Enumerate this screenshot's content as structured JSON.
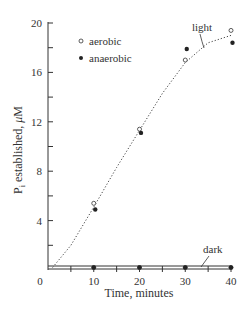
{
  "chart_data": {
    "type": "scatter",
    "title": "",
    "xlabel": "Time, minutes",
    "ylabel": "P_i established, μM",
    "ylabel_parts": {
      "main": "P",
      "sub": "i",
      "rest": " established, ",
      "unit_greek": "μ",
      "unit": "M"
    },
    "xlim": [
      0,
      40
    ],
    "ylim": [
      0,
      20
    ],
    "x_ticks": [
      "0",
      "10",
      "20",
      "30",
      "40"
    ],
    "y_ticks": [
      "4",
      "8",
      "12",
      "16",
      "20"
    ],
    "grid": false,
    "legend_position": "upper left",
    "legend": [
      {
        "label": "aerobic",
        "marker": "open-circle"
      },
      {
        "label": "anaerobic",
        "marker": "filled-circle"
      }
    ],
    "series": [
      {
        "name": "aerobic (light)",
        "marker": "open-circle",
        "x": [
          10,
          20,
          30,
          40
        ],
        "y": [
          5.4,
          11.4,
          17.0,
          19.4
        ]
      },
      {
        "name": "anaerobic (light)",
        "marker": "filled-circle",
        "x": [
          10,
          20,
          30,
          40
        ],
        "y": [
          4.9,
          11.1,
          17.9,
          18.4
        ]
      },
      {
        "name": "aerobic (dark)",
        "marker": "open-circle",
        "x": [
          10,
          20,
          30,
          40
        ],
        "y": [
          0.2,
          0.2,
          0.2,
          0.2
        ]
      },
      {
        "name": "anaerobic (dark)",
        "marker": "filled-circle",
        "x": [
          10,
          20,
          30,
          40
        ],
        "y": [
          0.1,
          0.1,
          0.1,
          0.1
        ]
      }
    ],
    "curves": [
      {
        "name": "light",
        "style": "dotted",
        "x": [
          1,
          5,
          10,
          15,
          20,
          25,
          30,
          35,
          40
        ],
        "y": [
          0.2,
          2.0,
          5.1,
          8.3,
          11.3,
          14.3,
          16.8,
          18.4,
          19.0
        ]
      },
      {
        "name": "dark",
        "style": "solid",
        "x": [
          0,
          40
        ],
        "y": [
          0.2,
          0.2
        ]
      }
    ],
    "annotations": [
      {
        "text": "light",
        "x": 36.5,
        "y": 19.4
      },
      {
        "text": "dark",
        "x": 37,
        "y": 1.4
      }
    ]
  }
}
